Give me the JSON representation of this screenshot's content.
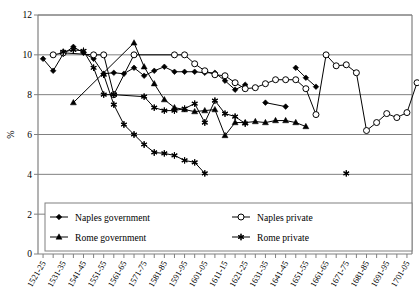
{
  "chart_data": {
    "type": "line",
    "title": "",
    "xlabel": "",
    "ylabel": "%",
    "ylim": [
      0,
      12
    ],
    "yticks": [
      0,
      2,
      4,
      6,
      8,
      10,
      12
    ],
    "grid": true,
    "legend_position": "bottom-inside",
    "categories": [
      "1521-25",
      "1526-30",
      "1531-35",
      "1536-40",
      "1541-45",
      "1546-50",
      "1551-55",
      "1556-60",
      "1561-65",
      "1566-70",
      "1571-75",
      "1576-80",
      "1581-85",
      "1586-90",
      "1591-95",
      "1596-600",
      "1601-05",
      "1606-10",
      "1611-15",
      "1616-20",
      "1621-25",
      "1626-30",
      "1631-35",
      "1636-40",
      "1641-45",
      "1646-50",
      "1651-55",
      "1656-60",
      "1661-65",
      "1666-70",
      "1671-75",
      "1676-80",
      "1681-85",
      "1686-90",
      "1691-95",
      "1696-700",
      "1701-05"
    ],
    "xtick_labels": [
      "1521-25",
      "1531-35",
      "1541-45",
      "1551-55",
      "1561-65",
      "1571-75",
      "1581-85",
      "1591-95",
      "1601-05",
      "1611-15",
      "1621-25",
      "1631-35",
      "1641-45",
      "1651-55",
      "1661-65",
      "1671-75",
      "1681-85",
      "1691-95",
      "1701-05"
    ],
    "series": [
      {
        "name": "Naples government",
        "marker": "filled-diamond",
        "color": "#000000",
        "points": [
          {
            "x": 0,
            "y": 9.8
          },
          {
            "x": 1,
            "y": 9.2
          },
          {
            "x": 2,
            "y": 10.05
          },
          {
            "x": 3,
            "y": 10.4
          },
          {
            "x": 4,
            "y": 10.1
          },
          {
            "x": 5,
            "y": 9.8
          },
          {
            "x": 6,
            "y": 9.05
          },
          {
            "x": 7,
            "y": 9.1
          },
          {
            "x": 8,
            "y": 9.05
          },
          {
            "x": 9,
            "y": 9.35
          },
          {
            "x": 10,
            "y": 8.95
          },
          {
            "x": 11,
            "y": 9.2
          },
          {
            "x": 12,
            "y": 9.4
          },
          {
            "x": 13,
            "y": 9.15
          },
          {
            "x": 14,
            "y": 9.15
          },
          {
            "x": 15,
            "y": 9.15
          },
          {
            "x": 16,
            "y": 9.1
          },
          {
            "x": 17,
            "y": 9.1
          },
          {
            "x": 18,
            "y": 8.7
          },
          {
            "x": 19,
            "y": 8.25
          },
          {
            "x": 20,
            "y": 8.5
          }
        ]
      },
      {
        "name": "Naples government (later segment)",
        "marker": "filled-diamond",
        "color": "#000000",
        "points": [
          {
            "x": 25,
            "y": 9.35
          },
          {
            "x": 26,
            "y": 8.85
          },
          {
            "x": 27,
            "y": 8.4
          }
        ]
      },
      {
        "name": "Naples government (isolated)",
        "marker": "filled-diamond",
        "color": "#000000",
        "points": [
          {
            "x": 22,
            "y": 7.6
          },
          {
            "x": 24,
            "y": 7.4
          }
        ]
      },
      {
        "name": "Naples private",
        "marker": "open-circle",
        "color": "#000000",
        "points": [
          {
            "x": 1,
            "y": 10.0
          },
          {
            "x": 2,
            "y": 10.1
          },
          {
            "x": 5,
            "y": 10.0
          },
          {
            "x": 6,
            "y": 10.0
          },
          {
            "x": 7,
            "y": 8.0
          },
          {
            "x": 9,
            "y": 10.0
          },
          {
            "x": 13,
            "y": 10.0
          },
          {
            "x": 14,
            "y": 10.0
          },
          {
            "x": 15,
            "y": 9.55
          },
          {
            "x": 16,
            "y": 9.2
          },
          {
            "x": 17,
            "y": 9.0
          },
          {
            "x": 18,
            "y": 8.95
          },
          {
            "x": 19,
            "y": 8.6
          },
          {
            "x": 20,
            "y": 8.3
          },
          {
            "x": 21,
            "y": 8.35
          },
          {
            "x": 22,
            "y": 8.55
          },
          {
            "x": 23,
            "y": 8.75
          },
          {
            "x": 24,
            "y": 8.75
          },
          {
            "x": 25,
            "y": 8.75
          },
          {
            "x": 26,
            "y": 8.3
          },
          {
            "x": 27,
            "y": 7.0
          },
          {
            "x": 28,
            "y": 10.0
          },
          {
            "x": 29,
            "y": 9.45
          },
          {
            "x": 30,
            "y": 9.5
          },
          {
            "x": 31,
            "y": 9.1
          },
          {
            "x": 32,
            "y": 6.2
          },
          {
            "x": 33,
            "y": 6.6
          },
          {
            "x": 34,
            "y": 7.05
          },
          {
            "x": 35,
            "y": 6.85
          },
          {
            "x": 36,
            "y": 7.1
          },
          {
            "x": 37,
            "y": 8.6
          }
        ]
      },
      {
        "name": "Rome government",
        "marker": "filled-triangle",
        "color": "#000000",
        "points": [
          {
            "x": 3,
            "y": 7.6
          },
          {
            "x": 9,
            "y": 10.6
          },
          {
            "x": 10,
            "y": 9.4
          },
          {
            "x": 11,
            "y": 8.55
          },
          {
            "x": 12,
            "y": 7.75
          },
          {
            "x": 13,
            "y": 7.35
          },
          {
            "x": 14,
            "y": 7.25
          },
          {
            "x": 15,
            "y": 7.15
          },
          {
            "x": 16,
            "y": 7.2
          },
          {
            "x": 17,
            "y": 7.25
          },
          {
            "x": 18,
            "y": 5.95
          },
          {
            "x": 19,
            "y": 6.6
          },
          {
            "x": 20,
            "y": 6.6
          },
          {
            "x": 21,
            "y": 6.65
          },
          {
            "x": 22,
            "y": 6.6
          },
          {
            "x": 23,
            "y": 6.7
          },
          {
            "x": 24,
            "y": 6.7
          },
          {
            "x": 25,
            "y": 6.6
          },
          {
            "x": 26,
            "y": 6.4
          }
        ]
      },
      {
        "name": "Rome private",
        "marker": "star-asterisk",
        "color": "#000000",
        "points": [
          {
            "x": 2,
            "y": 10.15
          },
          {
            "x": 3,
            "y": 10.25
          },
          {
            "x": 4,
            "y": 10.2
          },
          {
            "x": 5,
            "y": 9.35
          },
          {
            "x": 6,
            "y": 8.0
          },
          {
            "x": 7,
            "y": 8.0
          },
          {
            "x": 10,
            "y": 7.9
          },
          {
            "x": 11,
            "y": 7.35
          },
          {
            "x": 12,
            "y": 7.2
          },
          {
            "x": 13,
            "y": 7.2
          },
          {
            "x": 14,
            "y": 7.3
          },
          {
            "x": 15,
            "y": 7.55
          },
          {
            "x": 16,
            "y": 6.6
          },
          {
            "x": 17,
            "y": 7.7
          },
          {
            "x": 18,
            "y": 7.05
          },
          {
            "x": 19,
            "y": 6.9
          },
          {
            "x": 20,
            "y": 6.55
          }
        ]
      },
      {
        "name": "Rome private (decline segment)",
        "marker": "star-asterisk",
        "color": "#000000",
        "points": [
          {
            "x": 6,
            "y": 9.0
          },
          {
            "x": 7,
            "y": 7.5
          },
          {
            "x": 8,
            "y": 6.5
          },
          {
            "x": 9,
            "y": 6.0
          },
          {
            "x": 10,
            "y": 5.5
          },
          {
            "x": 11,
            "y": 5.1
          },
          {
            "x": 12,
            "y": 5.05
          },
          {
            "x": 13,
            "y": 4.95
          },
          {
            "x": 14,
            "y": 4.7
          },
          {
            "x": 15,
            "y": 4.6
          },
          {
            "x": 16,
            "y": 4.05
          }
        ]
      },
      {
        "name": "Rome private (isolated late)",
        "marker": "star-asterisk",
        "color": "#000000",
        "points": [
          {
            "x": 30,
            "y": 4.05
          }
        ]
      }
    ],
    "legend": [
      {
        "label": "Naples government",
        "marker": "filled-diamond"
      },
      {
        "label": "Naples private",
        "marker": "open-circle"
      },
      {
        "label": "Rome government",
        "marker": "filled-triangle"
      },
      {
        "label": "Rome private",
        "marker": "star-asterisk"
      }
    ]
  }
}
